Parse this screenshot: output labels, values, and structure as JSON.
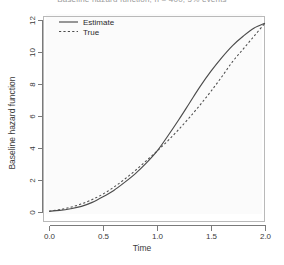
{
  "chart_data": {
    "type": "line",
    "title": "Baseline hazard function, n = 400, 5% events",
    "title_clipped": true,
    "xlabel": "Time",
    "ylabel": "Baseline hazard function",
    "xlim": [
      0,
      2
    ],
    "ylim": [
      0,
      12
    ],
    "xticks": [
      "0.0",
      "0.5",
      "1.0",
      "1.5",
      "2.0"
    ],
    "xtick_values": [
      0,
      0.5,
      1,
      1.5,
      2
    ],
    "yticks": [
      "0",
      "2",
      "4",
      "6",
      "8",
      "10",
      "12"
    ],
    "ytick_values": [
      0,
      2,
      4,
      6,
      8,
      10,
      12
    ],
    "grid": false,
    "legend_position": "top-left",
    "series": [
      {
        "name": "Estimate",
        "style": "solid",
        "color": "#4c4c4c",
        "x": [
          0.0,
          0.1,
          0.2,
          0.3,
          0.4,
          0.5,
          0.6,
          0.7,
          0.8,
          0.9,
          1.0,
          1.1,
          1.2,
          1.3,
          1.4,
          1.5,
          1.6,
          1.7,
          1.8,
          1.9,
          2.0
        ],
        "values": [
          0.05,
          0.1,
          0.2,
          0.35,
          0.6,
          0.95,
          1.35,
          1.85,
          2.4,
          3.05,
          3.8,
          4.75,
          5.75,
          6.8,
          7.85,
          8.8,
          9.65,
          10.4,
          11.0,
          11.5,
          11.8
        ]
      },
      {
        "name": "True",
        "style": "dashed",
        "color": "#4c4c4c",
        "x": [
          0.0,
          0.1,
          0.2,
          0.3,
          0.4,
          0.5,
          0.6,
          0.7,
          0.8,
          0.9,
          1.0,
          1.1,
          1.2,
          1.3,
          1.4,
          1.5,
          1.6,
          1.7,
          1.8,
          1.9,
          2.0
        ],
        "values": [
          0.05,
          0.15,
          0.3,
          0.5,
          0.78,
          1.12,
          1.55,
          2.05,
          2.6,
          3.2,
          3.8,
          4.45,
          5.15,
          5.9,
          6.7,
          7.55,
          8.45,
          9.4,
          10.2,
          11.0,
          11.8
        ]
      }
    ]
  },
  "legend": {
    "items": [
      {
        "label": "Estimate"
      },
      {
        "label": "True"
      }
    ]
  }
}
